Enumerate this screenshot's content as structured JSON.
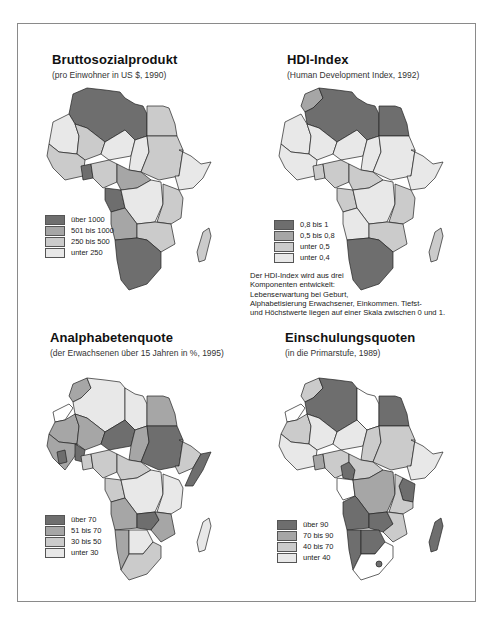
{
  "page": {
    "frame_border_color": "#8a8a8a"
  },
  "panels": [
    {
      "id": "bsp",
      "title": "Bruttosozialprodukt",
      "subtitle": "(pro Einwohner  in US $, 1990)",
      "legend": [
        {
          "label": "über 1000",
          "color": "#6e6e6e"
        },
        {
          "label": "501 bis 1000",
          "color": "#a6a6a6"
        },
        {
          "label": "250 bis 500",
          "color": "#cbcbcb"
        },
        {
          "label": "unter 250",
          "color": "#e8e8e8"
        }
      ]
    },
    {
      "id": "hdi",
      "title": "HDI-Index",
      "subtitle": "(Human Development Index, 1992)",
      "legend": [
        {
          "label": "0,8 bis 1",
          "color": "#6e6e6e"
        },
        {
          "label": "0,5 bis 0,8",
          "color": "#a6a6a6"
        },
        {
          "label": "unter 0,5",
          "color": "#cbcbcb"
        },
        {
          "label": "unter 0,4",
          "color": "#e8e8e8"
        }
      ],
      "note": [
        "Der HDI-Index wird aus drei",
        "Komponenten entwickelt:",
        "Lebenserwartung bei Geburt,",
        "Alphabetisierung Erwachsener, Einkommen. Tiefst-",
        "und Höchstwerte liegen auf einer Skala  zwischen 0 und 1."
      ]
    },
    {
      "id": "analph",
      "title": "Analphabetenquote",
      "subtitle": "(der Erwachsenen über 15 Jahren in %, 1995)",
      "legend": [
        {
          "label": "über 70",
          "color": "#6e6e6e"
        },
        {
          "label": "51 bis 70",
          "color": "#a6a6a6"
        },
        {
          "label": "30 bis 50",
          "color": "#cbcbcb"
        },
        {
          "label": "unter 30",
          "color": "#e8e8e8"
        }
      ]
    },
    {
      "id": "einsch",
      "title": "Einschulungsquoten",
      "subtitle": "(in die Primarstufe, 1989)",
      "legend": [
        {
          "label": "über 90",
          "color": "#6e6e6e"
        },
        {
          "label": "70 bis 90",
          "color": "#a6a6a6"
        },
        {
          "label": "40 bis 70",
          "color": "#cbcbcb"
        },
        {
          "label": "unter 40",
          "color": "#e8e8e8"
        }
      ]
    }
  ]
}
